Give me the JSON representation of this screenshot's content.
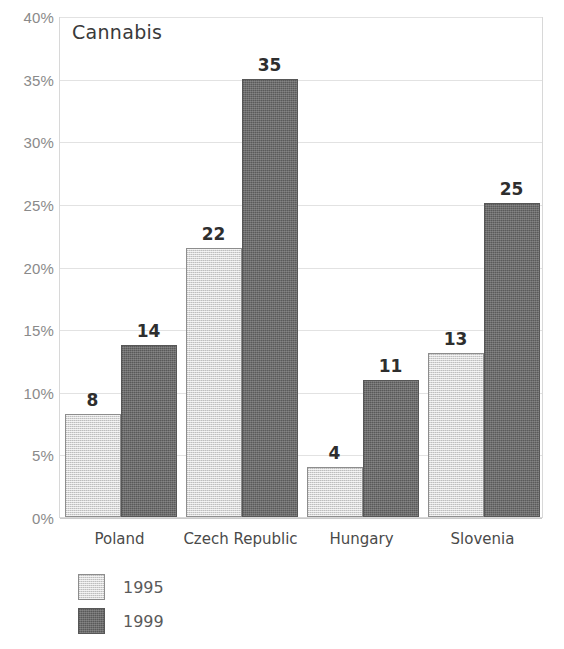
{
  "chart_data": {
    "type": "bar",
    "title": "Cannabis",
    "xlabel": "",
    "ylabel": "",
    "ylim": [
      0,
      40
    ],
    "grid": true,
    "legend_position": "bottom-left",
    "categories": [
      "Poland",
      "Czech Republic",
      "Hungary",
      "Slovenia"
    ],
    "ytick_labels": [
      "40%",
      "35%",
      "30%",
      "25%",
      "20%",
      "15%",
      "10%",
      "5%",
      "0%"
    ],
    "ytick_values": [
      40,
      35,
      30,
      25,
      20,
      15,
      10,
      5,
      0
    ],
    "series": [
      {
        "name": "1995",
        "color": "#d6d6d6",
        "values": [
          8,
          22,
          4,
          13
        ],
        "plotted_heights": [
          8.2,
          21.5,
          4.0,
          13.1
        ],
        "labels": [
          "8",
          "22",
          "4",
          "13"
        ]
      },
      {
        "name": "1999",
        "color": "#6d6d6d",
        "values": [
          14,
          35,
          11,
          25
        ],
        "plotted_heights": [
          13.7,
          35.0,
          10.9,
          25.1
        ],
        "labels": [
          "14",
          "35",
          "11",
          "25"
        ]
      }
    ]
  }
}
